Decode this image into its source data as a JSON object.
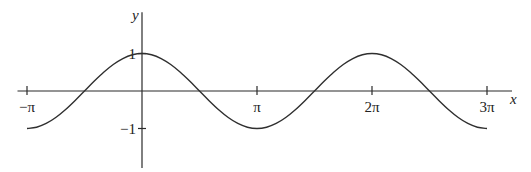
{
  "chart_data": {
    "type": "line",
    "title": "",
    "function": "y = cos(x)",
    "xlabel": "x",
    "ylabel": "y",
    "x_range_pi": [
      -1,
      3
    ],
    "samples_per_pi": 12,
    "y": [
      -1,
      -0.966,
      -0.866,
      -0.707,
      -0.5,
      -0.259,
      0,
      0.259,
      0.5,
      0.707,
      0.866,
      0.966,
      1,
      0.966,
      0.866,
      0.707,
      0.5,
      0.259,
      0,
      -0.259,
      -0.5,
      -0.707,
      -0.866,
      -0.966,
      -1,
      -0.966,
      -0.866,
      -0.707,
      -0.5,
      -0.259,
      0,
      0.259,
      0.5,
      0.707,
      0.866,
      0.966,
      1,
      0.966,
      0.866,
      0.707,
      0.5,
      0.259,
      0,
      -0.259,
      -0.5,
      -0.707,
      -0.866,
      -0.966,
      -1
    ],
    "xlim_pi": [
      -1.1,
      3.2
    ],
    "ylim": [
      -2.05,
      2.1
    ],
    "x_ticks": [
      {
        "value_pi": -1,
        "label": "−π"
      },
      {
        "value_pi": 1,
        "label": "π"
      },
      {
        "value_pi": 2,
        "label": "2π"
      },
      {
        "value_pi": 3,
        "label": "3π"
      }
    ],
    "y_ticks": [
      {
        "value": 1,
        "label": "1"
      },
      {
        "value": -1,
        "label": "−1"
      }
    ],
    "grid": false,
    "legend": "none"
  }
}
